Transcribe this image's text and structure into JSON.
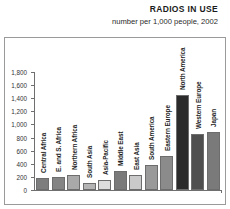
{
  "header": {
    "title": "RADIOS IN USE",
    "subtitle": "number per 1,000 people, 2002"
  },
  "chart_data": {
    "type": "bar",
    "title": "RADIOS IN USE",
    "subtitle": "number per 1,000 people, 2002",
    "xlabel": "",
    "ylabel": "",
    "ylim": [
      0,
      1800
    ],
    "grid": false,
    "legend": "none",
    "yticks": [
      "0",
      "200",
      "400",
      "600",
      "800",
      "1,000",
      "1,200",
      "1,400",
      "1,600",
      "1,800"
    ],
    "ytick_values": [
      0,
      200,
      400,
      600,
      800,
      1000,
      1200,
      1400,
      1600,
      1800
    ],
    "categories": [
      "Central Africa",
      "E. and S. Africa",
      "Northern Africa",
      "South Asia",
      "Asia-Pacific",
      "Middle East",
      "East Asia",
      "South America",
      "Eastern Europe",
      "North America",
      "Western Europe",
      "Japan"
    ],
    "values": [
      190,
      200,
      230,
      100,
      160,
      290,
      230,
      380,
      520,
      1450,
      860,
      880
    ],
    "bar_colors": [
      "#7d7d7d",
      "#848484",
      "#a9a9a9",
      "#b4b4b4",
      "#dcdcdc",
      "#7a7a7a",
      "#cacaca",
      "#9a9a9a",
      "#8b8b8b",
      "#2b2b2b",
      "#4f4f4f",
      "#7a7a7a"
    ]
  }
}
